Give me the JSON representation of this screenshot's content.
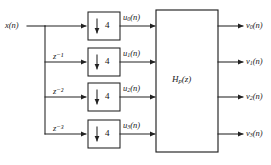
{
  "figure": {
    "type": "block-diagram",
    "background_color": "#ffffff",
    "line_color": "#222222",
    "text_color": "#1a1a1a"
  },
  "input": {
    "label_text": "x(n)",
    "var": "x",
    "arg": "(n)"
  },
  "delays": [
    {
      "id": "delay-0",
      "label": "",
      "exponent": "",
      "present": false
    },
    {
      "id": "delay-1",
      "base": "z",
      "exponent": "−1",
      "label_text": "z⁻¹"
    },
    {
      "id": "delay-2",
      "base": "z",
      "exponent": "−2",
      "label_text": "z⁻²"
    },
    {
      "id": "delay-3",
      "base": "z",
      "exponent": "−3",
      "label_text": "z⁻³"
    }
  ],
  "downsamplers": [
    {
      "id": "downsampler-0",
      "arrow": "↓",
      "factor": "4"
    },
    {
      "id": "downsampler-1",
      "arrow": "↓",
      "factor": "4"
    },
    {
      "id": "downsampler-2",
      "arrow": "↓",
      "factor": "4"
    },
    {
      "id": "downsampler-3",
      "arrow": "↓",
      "factor": "4"
    }
  ],
  "intermediate_signals": [
    {
      "id": "u0",
      "base": "u",
      "sub": "0",
      "arg": "(n)",
      "label_text": "u0(n)"
    },
    {
      "id": "u1",
      "base": "u",
      "sub": "1",
      "arg": "(n)",
      "label_text": "u1(n)"
    },
    {
      "id": "u2",
      "base": "u",
      "sub": "2",
      "arg": "(n)",
      "label_text": "u2(n)"
    },
    {
      "id": "u3",
      "base": "u",
      "sub": "3",
      "arg": "(n)",
      "label_text": "u3(n)"
    }
  ],
  "main_block": {
    "base": "H",
    "sub": "p",
    "arg": "(z)",
    "label_text": "Hp(z)"
  },
  "outputs": [
    {
      "id": "v0",
      "base": "v",
      "sub": "0",
      "arg": "(n)",
      "label_text": "v0(n)"
    },
    {
      "id": "v1",
      "base": "v",
      "sub": "1",
      "arg": "(n)",
      "label_text": "v1(n)"
    },
    {
      "id": "v2",
      "base": "v",
      "sub": "2",
      "arg": "(n)",
      "label_text": "v2(n)"
    },
    {
      "id": "v3",
      "base": "v",
      "sub": "3",
      "arg": "(n)",
      "label_text": "v3(n)"
    }
  ]
}
